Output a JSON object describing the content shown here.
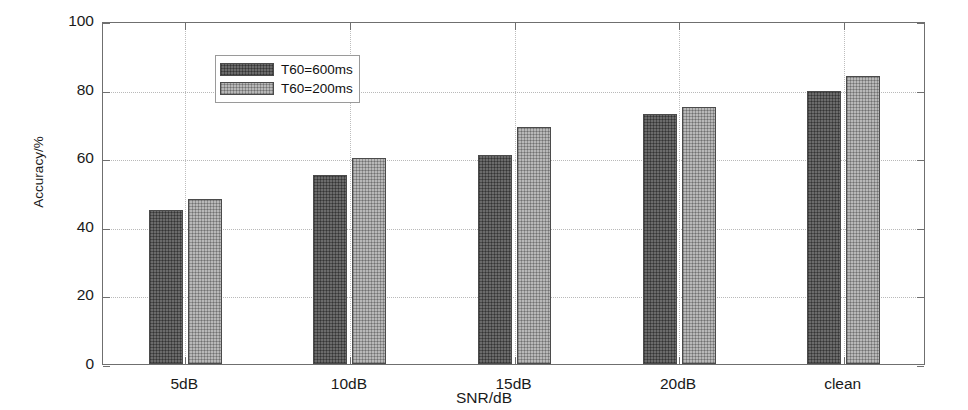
{
  "chart_data": {
    "type": "bar",
    "title": "",
    "xlabel": "SNR/dB",
    "ylabel": "Accuracy/%",
    "categories": [
      "5dB",
      "10dB",
      "15dB",
      "20dB",
      "clean"
    ],
    "series": [
      {
        "name": "T60=600ms",
        "values": [
          45,
          55,
          61,
          73,
          79.5
        ],
        "color": "#6b6b6b"
      },
      {
        "name": "T60=200ms",
        "values": [
          48,
          60,
          69,
          75,
          84
        ],
        "color": "#b8b8b8"
      }
    ],
    "ylim": [
      0,
      100
    ],
    "yticks": [
      0,
      20,
      40,
      60,
      80,
      100
    ],
    "ytick_labels": [
      "0",
      "20",
      "40",
      "60",
      "80",
      "100"
    ],
    "grid": true,
    "grid_style": "dotted",
    "legend_position": "top-left"
  },
  "axes": {
    "y_title": "Accuracy/%",
    "x_title": "SNR/dB"
  },
  "legend": {
    "entries": [
      {
        "label": "T60=600ms"
      },
      {
        "label": "T60=200ms"
      }
    ]
  },
  "style": {
    "axis_color": "#6f6f6f",
    "grid_color": "#bdbdbd",
    "background": "#ffffff",
    "bar_edge": "#4b4b4b"
  }
}
